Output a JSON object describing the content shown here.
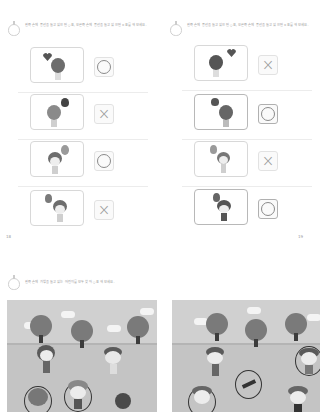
{
  "left_page": {
    "instruction": "왼쪽 손에 풍선을 들고 있으면 ○표, 오른쪽 손에 풍선을 들고 있으면 ×표를 해 보세요.",
    "page_number": "18",
    "items": [
      {
        "picture": "child-back-with-heart-balloon",
        "answer": "○"
      },
      {
        "picture": "child-back-with-flower-balloon",
        "answer": "×"
      },
      {
        "picture": "boy-holding-balloon-left",
        "answer": "○"
      },
      {
        "picture": "girl-holding-balloon-right",
        "answer": "×"
      }
    ]
  },
  "right_page": {
    "instruction": "왼쪽 손에 풍선을 들고 있으면 ○표, 오른쪽 손에 풍선을 들고 있으면 ×표를 해 보세요.",
    "page_number": "19",
    "items": [
      {
        "picture": "child-back-with-heart-balloon",
        "answer": "×"
      },
      {
        "picture": "child-back-with-flower-balloon",
        "answer": "○"
      },
      {
        "picture": "boy-holding-balloon-right",
        "answer": "×"
      },
      {
        "picture": "girl-holding-balloon-left",
        "answer": "○"
      }
    ]
  },
  "bottom_section": {
    "instruction": "왼쪽 손에 가방을 들고 있는 어린이를 모두 찾아 ○표 해 보세요.",
    "scenes": [
      {
        "name": "park-scene-left",
        "trees": 3,
        "clouds": 3,
        "children": 5,
        "circled": 3
      },
      {
        "name": "park-scene-right",
        "trees": 3,
        "clouds": 3,
        "children": 5,
        "circled": 3
      }
    ]
  },
  "colors": {
    "background": "#ffffff",
    "border": "#d8d8d8",
    "ink": "#6d6d6d",
    "ground": "#c4c4c4",
    "sky": "#d0d0d0"
  }
}
